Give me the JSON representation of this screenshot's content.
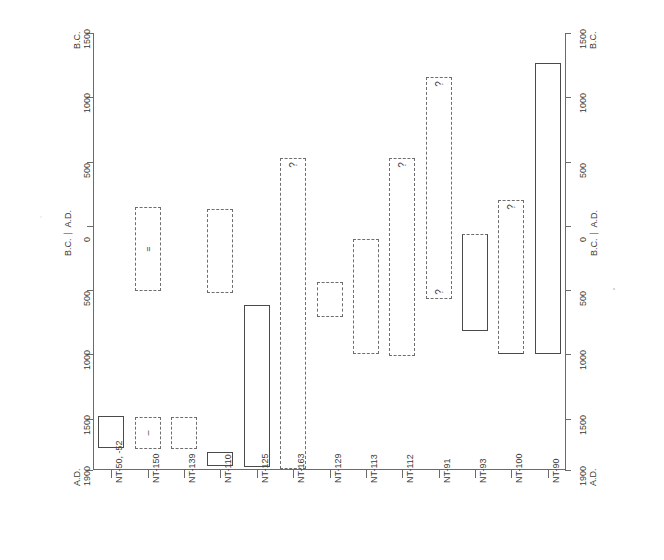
{
  "chart_data": {
    "type": "bar",
    "title": "",
    "subtitle": "",
    "xlabel": "",
    "ylabel_left": "B.C. | A.D.",
    "ylabel_right": "B.C. | A.D.",
    "orientation": "vertical-range-bars",
    "grid": false,
    "legend": "none",
    "y_axis": {
      "top_label": "B.C.",
      "top_value": "1500",
      "bottom_label": "A.D.",
      "bottom_value": "1900",
      "zero_label": "0",
      "era_top": "B.C.",
      "era_bottom": "A.D.",
      "ticks": [
        {
          "label": "1500",
          "era": "B.C.",
          "year": -1500
        },
        {
          "label": "1000",
          "era": "B.C.",
          "year": -1000
        },
        {
          "label": "500",
          "era": "B.C.",
          "year": -500
        },
        {
          "label": "0",
          "era": "",
          "year": 0
        },
        {
          "label": "500",
          "era": "A.D.",
          "year": 500
        },
        {
          "label": "1000",
          "era": "A.D.",
          "year": 1000
        },
        {
          "label": "1500",
          "era": "A.D.",
          "year": 1500
        },
        {
          "label": "1900",
          "era": "A.D.",
          "year": 1900
        }
      ],
      "range": [
        -1500,
        1900
      ]
    },
    "categories": [
      "NT-50, -52",
      "NT-150",
      "NT-139",
      "NT-110",
      "NT-125",
      "NT-163",
      "NT-129",
      "NT-113",
      "NT-112",
      "NT-91",
      "NT-93",
      "NT-100",
      "NT-90"
    ],
    "bars": [
      {
        "category": "NT-50, -52",
        "start_year": 1480,
        "end_year": 1730,
        "style": "solid",
        "marker": "",
        "query_top": false,
        "query_bottom": false
      },
      {
        "category": "NT-150",
        "start_year": 1490,
        "end_year": 1740,
        "style": "dashed",
        "marker": "–",
        "query_top": false,
        "query_bottom": false
      },
      {
        "category": "NT-150",
        "start_year": -150,
        "end_year": 510,
        "style": "dashed",
        "marker": "=",
        "query_top": false,
        "query_bottom": false
      },
      {
        "category": "NT-139",
        "start_year": 1490,
        "end_year": 1740,
        "style": "dashed",
        "marker": "",
        "query_top": false,
        "query_bottom": false
      },
      {
        "category": "NT-110",
        "start_year": 1760,
        "end_year": 1870,
        "style": "solid",
        "marker": "",
        "query_top": false,
        "query_bottom": false
      },
      {
        "category": "NT-110",
        "start_year": -130,
        "end_year": 520,
        "style": "dashed",
        "marker": "",
        "query_top": false,
        "query_bottom": false
      },
      {
        "category": "NT-125",
        "start_year": 620,
        "end_year": 1880,
        "style": "solid",
        "marker": "",
        "query_top": false,
        "query_bottom": false
      },
      {
        "category": "NT-163",
        "start_year": -530,
        "end_year": 1890,
        "style": "dashed",
        "marker": "",
        "query_top": true,
        "query_bottom": false
      },
      {
        "category": "NT-129",
        "start_year": 440,
        "end_year": 710,
        "style": "dashed",
        "marker": "",
        "query_top": false,
        "query_bottom": false
      },
      {
        "category": "NT-113",
        "start_year": 100,
        "end_year": 1000,
        "style": "dashed",
        "marker": "",
        "query_top": false,
        "query_bottom": false
      },
      {
        "category": "NT-112",
        "start_year": -530,
        "end_year": 1010,
        "style": "dashed",
        "marker": "",
        "query_top": true,
        "query_bottom": false
      },
      {
        "category": "NT-91",
        "start_year": -1160,
        "end_year": 570,
        "style": "dashed",
        "marker": "",
        "query_top": true,
        "query_bottom": true
      },
      {
        "category": "NT-93",
        "start_year": 60,
        "end_year": 820,
        "style": "dashed-top",
        "marker": "",
        "query_top": false,
        "query_bottom": false
      },
      {
        "category": "NT-100",
        "start_year": -200,
        "end_year": 1000,
        "style": "open-bottom-dashed",
        "marker": "",
        "query_top": true,
        "query_bottom": false
      },
      {
        "category": "NT-90",
        "start_year": -1270,
        "end_year": 1000,
        "style": "solid",
        "marker": "",
        "query_top": false,
        "query_bottom": false
      }
    ],
    "query_symbol": "?"
  },
  "meta": {
    "background_color": "#ffffff",
    "line_color": "#4a4a4a",
    "dashed_color": "#6e6e6e",
    "text_color": "#3a3a3a"
  }
}
